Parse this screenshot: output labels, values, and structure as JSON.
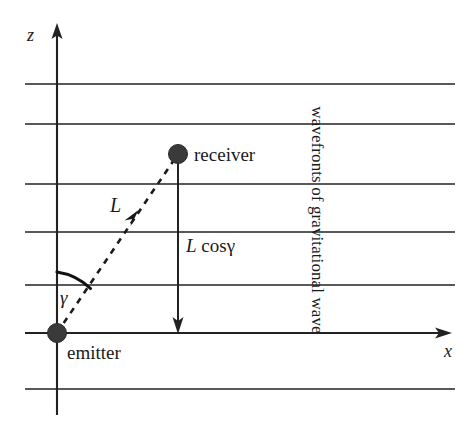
{
  "figure": {
    "axes": {
      "vertical_label": "z",
      "horizontal_label": "x"
    },
    "nodes": {
      "emitter_label": "emitter",
      "receiver_label": "receiver"
    },
    "annotations": {
      "baseline_label": "L",
      "projection_label_prefix": "L",
      "projection_label_suffix": "cosγ",
      "angle_label": "γ",
      "wavefront_caption": "wavefronts of gravitational wave"
    },
    "colors": {
      "ink": "#1a1a1a",
      "line": "#222222",
      "node_fill": "#3a3a3a",
      "background": "#ffffff"
    },
    "geometry": {
      "origin_x": 57,
      "origin_y": 333,
      "receiver_x": 178,
      "receiver_y": 154,
      "z_axis_tip_y": 25,
      "z_axis_bottom_y": 415,
      "x_axis_left": 25,
      "x_axis_tip_x": 450,
      "wavefront_left": 25,
      "wavefront_right": 455,
      "wavefront_ys": [
        84,
        124,
        184,
        232,
        285,
        333,
        389
      ],
      "node_radius": 9
    }
  }
}
